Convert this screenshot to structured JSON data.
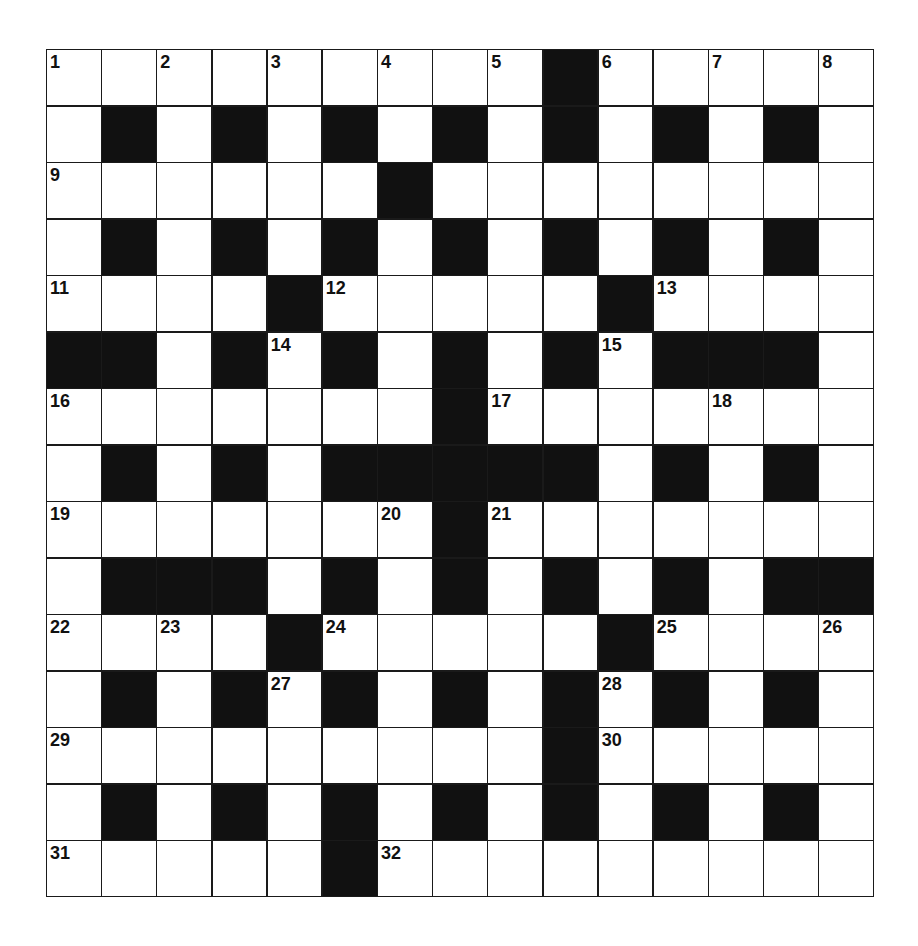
{
  "puzzle": {
    "type": "crossword",
    "size": {
      "rows": 15,
      "cols": 15
    },
    "colors": {
      "black": "#111111",
      "white": "#ffffff",
      "line": "#1a1a1a"
    },
    "grid": [
      ".........#.....",
      ".#.#.#.#.#.#.#.",
      "......#........",
      ".#.#.#.#.#.#.#.",
      "....#.....#....",
      "##.#.#.#.#.###.",
      ".......#.......",
      ".#.#.#####.#.#.",
      ".......#.......",
      ".###.#.#.#.#.##",
      "....#.....#....",
      ".#.#.#.#.#.#.#.",
      ".........#.....",
      ".#.#.#.#.#.#.#.",
      ".....#........."
    ],
    "numbers": [
      {
        "n": "1",
        "r": 0,
        "c": 0
      },
      {
        "n": "2",
        "r": 0,
        "c": 2
      },
      {
        "n": "3",
        "r": 0,
        "c": 4
      },
      {
        "n": "4",
        "r": 0,
        "c": 6
      },
      {
        "n": "5",
        "r": 0,
        "c": 8
      },
      {
        "n": "6",
        "r": 0,
        "c": 10
      },
      {
        "n": "7",
        "r": 0,
        "c": 12
      },
      {
        "n": "8",
        "r": 0,
        "c": 14
      },
      {
        "n": "9",
        "r": 2,
        "c": 0
      },
      {
        "n": "10",
        "r": 2,
        "c": 6
      },
      {
        "n": "11",
        "r": 4,
        "c": 0
      },
      {
        "n": "12",
        "r": 4,
        "c": 5
      },
      {
        "n": "13",
        "r": 4,
        "c": 11
      },
      {
        "n": "14",
        "r": 5,
        "c": 4
      },
      {
        "n": "15",
        "r": 5,
        "c": 10
      },
      {
        "n": "16",
        "r": 6,
        "c": 0
      },
      {
        "n": "17",
        "r": 6,
        "c": 8
      },
      {
        "n": "18",
        "r": 6,
        "c": 12
      },
      {
        "n": "19",
        "r": 8,
        "c": 0
      },
      {
        "n": "20",
        "r": 8,
        "c": 6
      },
      {
        "n": "21",
        "r": 8,
        "c": 8
      },
      {
        "n": "22",
        "r": 10,
        "c": 0
      },
      {
        "n": "23",
        "r": 10,
        "c": 2
      },
      {
        "n": "24",
        "r": 10,
        "c": 5
      },
      {
        "n": "25",
        "r": 10,
        "c": 11
      },
      {
        "n": "26",
        "r": 10,
        "c": 14
      },
      {
        "n": "27",
        "r": 11,
        "c": 4
      },
      {
        "n": "28",
        "r": 11,
        "c": 10
      },
      {
        "n": "29",
        "r": 12,
        "c": 0
      },
      {
        "n": "30",
        "r": 12,
        "c": 10
      },
      {
        "n": "31",
        "r": 14,
        "c": 0
      },
      {
        "n": "32",
        "r": 14,
        "c": 6
      }
    ]
  }
}
